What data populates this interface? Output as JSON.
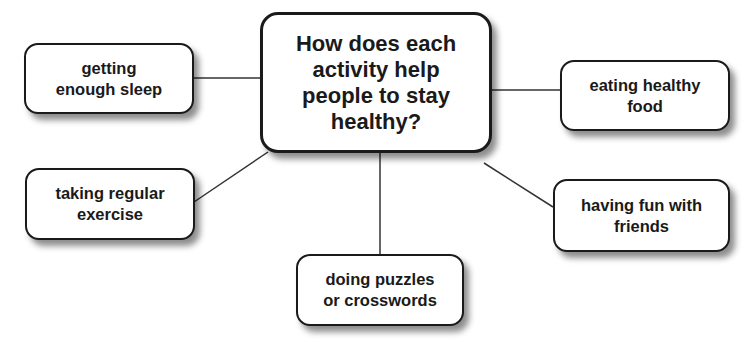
{
  "diagram": {
    "type": "mind-map",
    "center": {
      "text": "How does each activity help people to stay healthy?",
      "lines": [
        "How does each",
        "activity help",
        "people to stay",
        "healthy?"
      ]
    },
    "nodes": [
      {
        "id": "sleep",
        "lines": [
          "getting",
          "enough sleep"
        ]
      },
      {
        "id": "exercise",
        "lines": [
          "taking regular",
          "exercise"
        ]
      },
      {
        "id": "puzzles",
        "lines": [
          "doing puzzles",
          "or crosswords"
        ]
      },
      {
        "id": "food",
        "lines": [
          "eating healthy",
          "food"
        ]
      },
      {
        "id": "friends",
        "lines": [
          "having fun with",
          "friends"
        ]
      }
    ],
    "colors": {
      "stroke": "#1a1a1a",
      "background": "#ffffff"
    }
  }
}
